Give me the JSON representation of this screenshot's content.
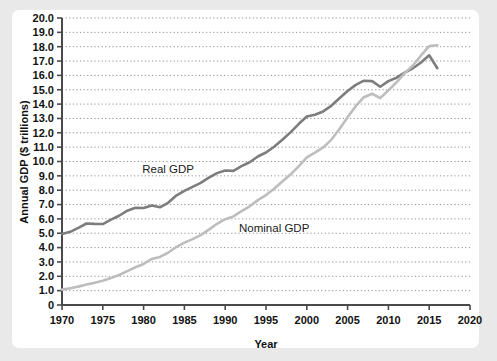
{
  "chart_data": {
    "type": "line",
    "title": "",
    "xlabel": "Year",
    "ylabel": "Annual GDP ($ trillions)",
    "xlim": [
      1970,
      2020
    ],
    "ylim": [
      0,
      20
    ],
    "xticks": [
      "1970",
      "1975",
      "1980",
      "1985",
      "1990",
      "1995",
      "2000",
      "2005",
      "2010",
      "2015",
      "2020"
    ],
    "yticks": [
      "0",
      "1.0",
      "2.0",
      "3.0",
      "4.0",
      "5.0",
      "6.0",
      "7.0",
      "8.0",
      "9.0",
      "10.0",
      "11.0",
      "12.0",
      "13.0",
      "14.0",
      "15.0",
      "16.0",
      "17.0",
      "18.0",
      "19.0",
      "20.0"
    ],
    "grid": "horizontal-dotted",
    "legend_position": "inline-annotations",
    "x": [
      1970,
      1971,
      1972,
      1973,
      1974,
      1975,
      1976,
      1977,
      1978,
      1979,
      1980,
      1981,
      1982,
      1983,
      1984,
      1985,
      1986,
      1987,
      1988,
      1989,
      1990,
      1991,
      1992,
      1993,
      1994,
      1995,
      1996,
      1997,
      1998,
      1999,
      2000,
      2001,
      2002,
      2003,
      2004,
      2005,
      2006,
      2007,
      2008,
      2009,
      2010,
      2011,
      2012,
      2013,
      2014,
      2015,
      2016
    ],
    "series": [
      {
        "name": "Real GDP",
        "color": "#7d7d7d",
        "label_x": 1983,
        "label_y": 9.2,
        "values": [
          4.95,
          5.1,
          5.38,
          5.68,
          5.65,
          5.64,
          5.95,
          6.22,
          6.57,
          6.78,
          6.76,
          6.93,
          6.81,
          7.12,
          7.63,
          7.95,
          8.23,
          8.51,
          8.87,
          9.19,
          9.37,
          9.35,
          9.68,
          9.95,
          10.35,
          10.63,
          11.03,
          11.52,
          12.03,
          12.61,
          13.13,
          13.26,
          13.49,
          13.88,
          14.41,
          14.91,
          15.34,
          15.63,
          15.6,
          15.21,
          15.6,
          15.84,
          16.2,
          16.5,
          16.9,
          17.4,
          16.5
        ]
      },
      {
        "name": "Nominal GDP",
        "color": "#bdbdbd",
        "label_x": 1996,
        "label_y": 5.1,
        "values": [
          1.07,
          1.17,
          1.28,
          1.43,
          1.55,
          1.69,
          1.88,
          2.09,
          2.36,
          2.63,
          2.86,
          3.21,
          3.35,
          3.64,
          4.04,
          4.35,
          4.59,
          4.87,
          5.25,
          5.66,
          5.98,
          6.17,
          6.54,
          6.88,
          7.31,
          7.66,
          8.1,
          8.61,
          9.09,
          9.66,
          10.29,
          10.62,
          10.98,
          11.51,
          12.27,
          13.09,
          13.86,
          14.48,
          14.72,
          14.42,
          14.96,
          15.52,
          16.16,
          16.69,
          17.39,
          18.04,
          18.1
        ]
      }
    ]
  },
  "axis": {
    "x_title": "Year",
    "y_title": "Annual GDP ($ trillions)"
  }
}
